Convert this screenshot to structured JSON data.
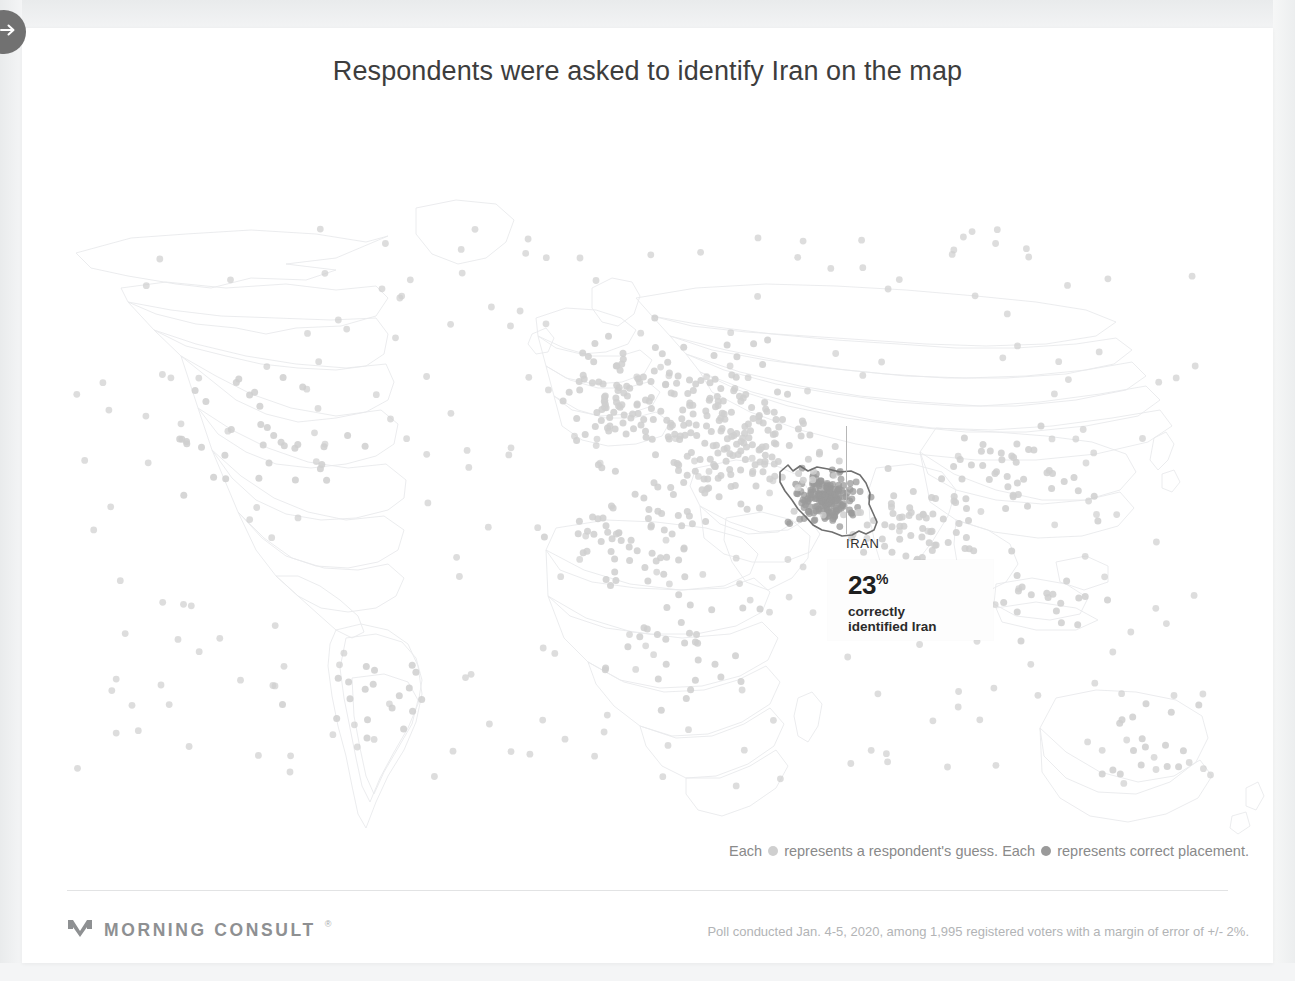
{
  "nav": {
    "next_button": "next-slide",
    "icon": "arrow-right-icon"
  },
  "header": {
    "title": "Respondents were asked to identify Iran on the map"
  },
  "annotation": {
    "country_label": "IRAN",
    "value": "23",
    "percent_symbol": "%",
    "description_line1": "correctly",
    "description_line2": "identified Iran"
  },
  "legend": {
    "prefix1": "Each",
    "text1": "represents a respondent's guess. Each",
    "text2": "represents correct placement.",
    "guess_color": "#cfcfcf",
    "correct_color": "#9a9a9a"
  },
  "footer": {
    "brand": "MORNING CONSULT",
    "brand_mark": "morning-consult-logo",
    "registered": "®",
    "note": "Poll conducted Jan. 4-5, 2020, among 1,995 registered voters with a margin of error of +/- 2%."
  },
  "chart_data": {
    "type": "scatter",
    "title": "Respondents were asked to identify Iran on the map",
    "subtitle": "",
    "xlabel": "",
    "ylabel": "",
    "projection": "equirectangular-world",
    "units": "respondent guesses (one dot per respondent)",
    "total_respondents": 1995,
    "correct_pct": 23,
    "target_country": "Iran",
    "legend_position": "bottom-right",
    "grid": false,
    "series": [
      {
        "name": "respondent guess",
        "color": "#cfcfcf",
        "marker_size": 7,
        "count": 1995
      },
      {
        "name": "correct placement",
        "color": "#9a9a9a",
        "marker_size": 7,
        "count": 459
      }
    ],
    "clusters": [
      {
        "name": "Iran (correct)",
        "cx": 790,
        "cy": 360,
        "spread": 38,
        "n": 430,
        "dark": true
      },
      {
        "name": "Middle East / Central Asia",
        "cx": 700,
        "cy": 310,
        "spread": 95,
        "n": 330
      },
      {
        "name": "Eastern Europe / Russia",
        "cx": 640,
        "cy": 270,
        "spread": 110,
        "n": 210
      },
      {
        "name": "South Asia",
        "cx": 880,
        "cy": 390,
        "spread": 85,
        "n": 160
      },
      {
        "name": "North Africa",
        "cx": 600,
        "cy": 400,
        "spread": 90,
        "n": 140
      },
      {
        "name": "Europe",
        "cx": 570,
        "cy": 255,
        "spread": 70,
        "n": 110
      },
      {
        "name": "East Asia",
        "cx": 980,
        "cy": 330,
        "spread": 90,
        "n": 95
      },
      {
        "name": "Sub-Saharan Africa",
        "cx": 660,
        "cy": 510,
        "spread": 95,
        "n": 70
      },
      {
        "name": "North America",
        "cx": 230,
        "cy": 300,
        "spread": 130,
        "n": 85
      },
      {
        "name": "South America",
        "cx": 330,
        "cy": 560,
        "spread": 100,
        "n": 45
      },
      {
        "name": "Australia",
        "cx": 1100,
        "cy": 610,
        "spread": 75,
        "n": 40
      },
      {
        "name": "Southeast Asia",
        "cx": 1010,
        "cy": 450,
        "spread": 70,
        "n": 45
      }
    ]
  }
}
